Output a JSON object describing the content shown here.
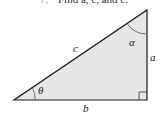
{
  "header": {
    "number": "7.",
    "instruction": "Find a, c, and c."
  },
  "triangle": {
    "labels": {
      "hypotenuse": "c",
      "vertical_leg": "a",
      "horizontal_leg": "b",
      "angle_bottom": "θ",
      "angle_top": "α"
    },
    "fill": "#e6e6e6",
    "stroke": "#1a1a1a"
  }
}
